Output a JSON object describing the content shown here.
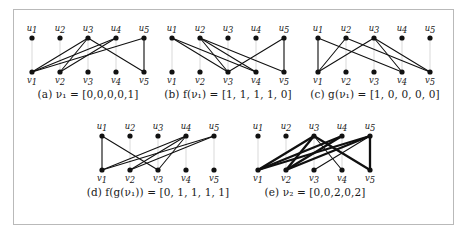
{
  "figure": {
    "border_color": "#b9b9b9",
    "background": "#ffffff",
    "edge_color": "#101010",
    "node_color": "#111111",
    "stem_color": "#c8c8c8"
  },
  "node_labels": {
    "top": [
      "u1",
      "u2",
      "u3",
      "u4",
      "u5"
    ],
    "bottom": [
      "v1",
      "v2",
      "v3",
      "v4",
      "v5"
    ],
    "top_base": [
      "u",
      "u",
      "u",
      "u",
      "u"
    ],
    "top_sub": [
      "1",
      "2",
      "3",
      "4",
      "5"
    ],
    "bottom_base": [
      "v",
      "v",
      "v",
      "v",
      "v"
    ],
    "bottom_sub": [
      "1",
      "2",
      "3",
      "4",
      "5"
    ]
  },
  "panels": [
    {
      "id": "a",
      "tag": "(a)",
      "symbol": "ν",
      "symbol_sub": "1",
      "expr_prefix": "",
      "caption": "(a)  ν₁ = [0,0,0,0,1]",
      "vector": [
        0,
        0,
        0,
        0,
        1
      ],
      "vector_text": "[0,0,0,0,1]",
      "edges": [
        {
          "from": "v1",
          "to": "u3",
          "weight": 1
        },
        {
          "from": "v1",
          "to": "u4",
          "weight": 1
        },
        {
          "from": "v1",
          "to": "u5",
          "weight": 1
        },
        {
          "from": "v2",
          "to": "u3",
          "weight": 1
        },
        {
          "from": "v2",
          "to": "u4",
          "weight": 1
        },
        {
          "from": "v5",
          "to": "u3",
          "weight": 1
        },
        {
          "from": "v5",
          "to": "u5",
          "weight": 1
        }
      ]
    },
    {
      "id": "b",
      "tag": "(b)",
      "symbol": "f(ν₁)",
      "symbol_sub": "",
      "caption": "(b)  f(ν₁) = [1, 1, 1, 1, 0]",
      "vector": [
        1,
        1,
        1,
        1,
        0
      ],
      "vector_text": "[1, 1, 1, 1, 0]",
      "edges": [
        {
          "from": "u1",
          "to": "v3",
          "weight": 1
        },
        {
          "from": "u1",
          "to": "v4",
          "weight": 1
        },
        {
          "from": "u2",
          "to": "v3",
          "weight": 1
        },
        {
          "from": "u2",
          "to": "v4",
          "weight": 1
        },
        {
          "from": "u2",
          "to": "v5",
          "weight": 1
        },
        {
          "from": "u5",
          "to": "v3",
          "weight": 1
        },
        {
          "from": "u5",
          "to": "v5",
          "weight": 1
        }
      ]
    },
    {
      "id": "c",
      "tag": "(c)",
      "symbol": "g(ν₁)",
      "symbol_sub": "",
      "caption": "(c)  g(ν₁) = [1, 0, 0, 0, 0]",
      "vector": [
        1,
        0,
        0,
        0,
        0
      ],
      "vector_text": "[1, 0, 0, 0, 0]",
      "edges": [
        {
          "from": "u1",
          "to": "v1",
          "weight": 1
        },
        {
          "from": "u1",
          "to": "v4",
          "weight": 1
        },
        {
          "from": "u2",
          "to": "v1",
          "weight": 1
        },
        {
          "from": "u2",
          "to": "v5",
          "weight": 1
        },
        {
          "from": "u3",
          "to": "v1",
          "weight": 1
        },
        {
          "from": "u3",
          "to": "v4",
          "weight": 1
        },
        {
          "from": "u3",
          "to": "v5",
          "weight": 1
        }
      ]
    },
    {
      "id": "d",
      "tag": "(d)",
      "symbol": "f(g(ν₁))",
      "symbol_sub": "",
      "caption": "(d)  f(g(ν₁)) = [0, 1, 1, 1, 1]",
      "vector": [
        0,
        1,
        1,
        1,
        1
      ],
      "vector_text": "[0, 1, 1, 1, 1]",
      "edges": [
        {
          "from": "u1",
          "to": "v1",
          "weight": 1
        },
        {
          "from": "u1",
          "to": "v3",
          "weight": 1
        },
        {
          "from": "u4",
          "to": "v1",
          "weight": 1
        },
        {
          "from": "u4",
          "to": "v2",
          "weight": 1
        },
        {
          "from": "u4",
          "to": "v3",
          "weight": 1
        },
        {
          "from": "u5",
          "to": "v1",
          "weight": 1
        },
        {
          "from": "u5",
          "to": "v2",
          "weight": 1
        }
      ]
    },
    {
      "id": "e",
      "tag": "(e)",
      "symbol": "ν",
      "symbol_sub": "2",
      "caption": "(e)  ν₂ = [0,0,2,0,2]",
      "vector": [
        0,
        0,
        2,
        0,
        2
      ],
      "vector_text": "[0,0,2,0,2]",
      "edges": [
        {
          "from": "v1",
          "to": "u3",
          "weight": 2
        },
        {
          "from": "v1",
          "to": "u4",
          "weight": 2
        },
        {
          "from": "v1",
          "to": "u5",
          "weight": 2
        },
        {
          "from": "v2",
          "to": "u3",
          "weight": 2
        },
        {
          "from": "v2",
          "to": "u4",
          "weight": 2
        },
        {
          "from": "v2",
          "to": "u5",
          "weight": 2
        },
        {
          "from": "v3",
          "to": "u5",
          "weight": 1
        },
        {
          "from": "v4",
          "to": "u3",
          "weight": 1
        },
        {
          "from": "v5",
          "to": "u3",
          "weight": 2
        },
        {
          "from": "v5",
          "to": "u5",
          "weight": 2
        }
      ]
    }
  ]
}
